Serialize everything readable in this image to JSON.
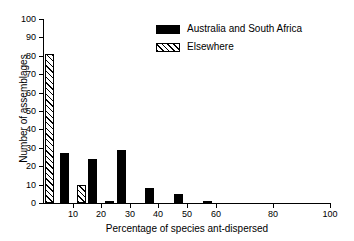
{
  "chart_data": {
    "type": "bar",
    "title": "",
    "subtitle": "",
    "xlabel": "Percentage of species ant-dispersed",
    "ylabel": "Number of assemblages",
    "xlim": [
      0,
      100
    ],
    "ylim": [
      0,
      100
    ],
    "grid": false,
    "legend_position": "top-right",
    "xticks": [
      10,
      20,
      30,
      40,
      50,
      60,
      80,
      100
    ],
    "xtick_labels": [
      "10",
      "20",
      "30",
      "40",
      "50",
      "60",
      "80",
      "100"
    ],
    "yticks": [
      0,
      10,
      20,
      30,
      40,
      50,
      60,
      70,
      80,
      90,
      100
    ],
    "ytick_labels": [
      "0",
      "10",
      "20",
      "30",
      "40",
      "50",
      "60",
      "70",
      "80",
      "90",
      "100"
    ],
    "series": [
      {
        "name": "Australia and South Africa",
        "fill": "solid",
        "color": "#000000",
        "points": [
          {
            "x": 7,
            "value": 27
          },
          {
            "x": 17,
            "value": 24
          },
          {
            "x": 27,
            "value": 29
          },
          {
            "x": 37,
            "value": 8
          },
          {
            "x": 47,
            "value": 5
          },
          {
            "x": 57,
            "value": 1
          }
        ]
      },
      {
        "name": "Elsewhere",
        "fill": "hatched",
        "color": "#000000",
        "points": [
          {
            "x": 2,
            "value": 81
          },
          {
            "x": 13,
            "value": 10
          },
          {
            "x": 23,
            "value": 1
          }
        ]
      }
    ]
  },
  "legend": {
    "items": [
      {
        "label": "Australia and South Africa",
        "fill": "solid"
      },
      {
        "label": "Elsewhere",
        "fill": "hatched"
      }
    ]
  }
}
